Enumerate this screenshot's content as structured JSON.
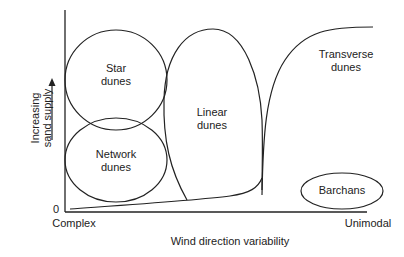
{
  "diagram": {
    "regions": [
      {
        "id": "star",
        "line1": "Star",
        "line2": "dunes"
      },
      {
        "id": "network",
        "line1": "Network",
        "line2": "dunes"
      },
      {
        "id": "linear",
        "line1": "Linear",
        "line2": "dunes"
      },
      {
        "id": "transverse",
        "line1": "Transverse",
        "line2": "dunes"
      },
      {
        "id": "barchans",
        "line1": "Barchans"
      }
    ],
    "axes": {
      "y_label_line1": "Increasing",
      "y_label_line2": "sand supply",
      "origin": "0",
      "x_left": "Complex",
      "x_right": "Unimodal",
      "x_label": "Wind direction variability"
    },
    "colors": {
      "line": "#222222",
      "background": "#ffffff"
    }
  }
}
